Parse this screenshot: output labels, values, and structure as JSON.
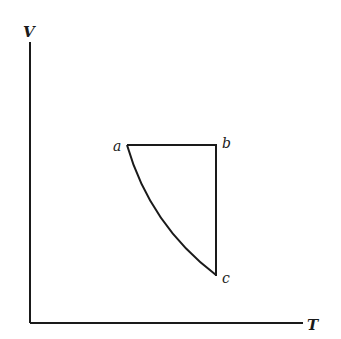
{
  "diagram": {
    "type": "thermodynamic-cycle-VT",
    "axes": {
      "y_label": "V",
      "x_label": "T"
    },
    "points": [
      {
        "id": "a",
        "label": "a",
        "x": 127,
        "y": 145
      },
      {
        "id": "b",
        "label": "b",
        "x": 216,
        "y": 145
      },
      {
        "id": "c",
        "label": "c",
        "x": 216,
        "y": 275
      }
    ],
    "segments": [
      {
        "from": "a",
        "to": "b",
        "shape": "straight",
        "description": "horizontal (constant V)"
      },
      {
        "from": "b",
        "to": "c",
        "shape": "straight",
        "description": "vertical (constant T)"
      },
      {
        "from": "c",
        "to": "a",
        "shape": "curve",
        "description": "concave curve"
      }
    ],
    "colors": {
      "line": "#1a1a1a",
      "background": "#ffffff"
    }
  }
}
